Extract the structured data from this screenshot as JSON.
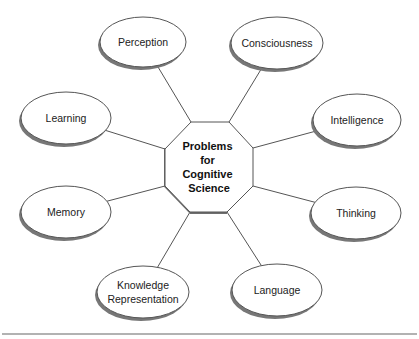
{
  "diagram": {
    "title_lines": [
      "Problems",
      "for",
      "Cognitive",
      "Science"
    ],
    "center": {
      "shape": "octagon",
      "cx": 209,
      "cy": 167
    },
    "nodes": [
      {
        "id": "perception",
        "lines": [
          "Perception"
        ],
        "cx": 143,
        "cy": 42,
        "rx": 43,
        "ry": 25,
        "attach": [
          191,
          122
        ]
      },
      {
        "id": "consciousness",
        "lines": [
          "Consciousness"
        ],
        "cx": 277,
        "cy": 43,
        "rx": 46,
        "ry": 26,
        "attach": [
          229,
          122
        ]
      },
      {
        "id": "learning",
        "lines": [
          "Learning"
        ],
        "cx": 66,
        "cy": 118,
        "rx": 45,
        "ry": 26,
        "attach": [
          165,
          149
        ]
      },
      {
        "id": "intelligence",
        "lines": [
          "Intelligence"
        ],
        "cx": 357,
        "cy": 120,
        "rx": 44,
        "ry": 26,
        "attach": [
          253,
          148
        ]
      },
      {
        "id": "memory",
        "lines": [
          "Memory"
        ],
        "cx": 66,
        "cy": 212,
        "rx": 45,
        "ry": 26,
        "attach": [
          165,
          186
        ]
      },
      {
        "id": "thinking",
        "lines": [
          "Thinking"
        ],
        "cx": 356,
        "cy": 213,
        "rx": 45,
        "ry": 26,
        "attach": [
          253,
          186
        ]
      },
      {
        "id": "knowledge-representation",
        "lines": [
          "Knowledge",
          "Representation"
        ],
        "cx": 143,
        "cy": 292,
        "rx": 46,
        "ry": 26,
        "attach": [
          190,
          212
        ]
      },
      {
        "id": "language",
        "lines": [
          "Language"
        ],
        "cx": 277,
        "cy": 290,
        "rx": 45,
        "ry": 26,
        "attach": [
          227,
          212
        ]
      }
    ],
    "colors": {
      "stroke": "#555555",
      "shadow": "#777777",
      "fill": "#ffffff",
      "rule": "#666666"
    }
  }
}
